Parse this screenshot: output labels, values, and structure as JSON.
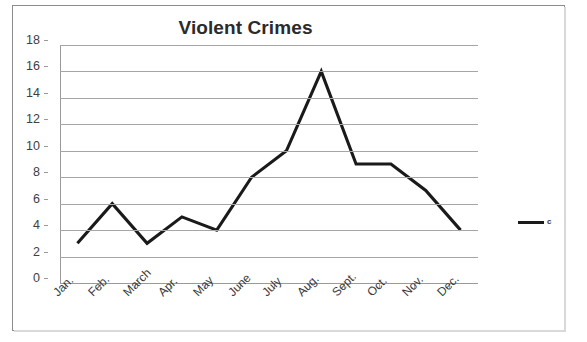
{
  "chart_data": {
    "type": "line",
    "title": "Violent Crimes",
    "xlabel": "",
    "ylabel": "",
    "categories": [
      "Jan.",
      "Feb.",
      "March",
      "Apr.",
      "May",
      "June",
      "July",
      "Aug.",
      "Sept.",
      "Oct.",
      "Nov.",
      "Dec."
    ],
    "series": [
      {
        "name": "c",
        "values": [
          3,
          6,
          3,
          5,
          4,
          8,
          10,
          16,
          9,
          9,
          7,
          4
        ],
        "color": "#1a1a1a"
      }
    ],
    "ylim": [
      0,
      18
    ],
    "yticks": [
      0,
      2,
      4,
      6,
      8,
      10,
      12,
      14,
      16,
      18
    ],
    "ytick_labels": [
      "0",
      "2",
      "4",
      "6",
      "8",
      "10",
      "12",
      "14",
      "16",
      "18"
    ],
    "grid": true,
    "grid_axis": "y",
    "grid_color": "#a6a6a6",
    "legend": true,
    "legend_position": "right",
    "legend_entries": [
      "c"
    ],
    "xtick_rotation": -45,
    "background": "#ffffff",
    "border_color": "#8d8d8d"
  }
}
